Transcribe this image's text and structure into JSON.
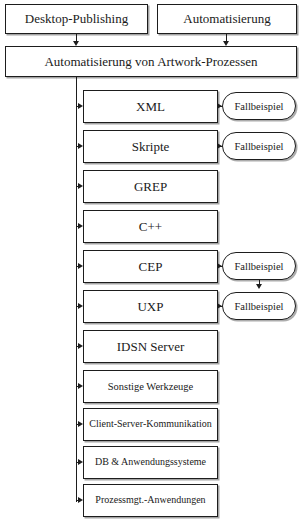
{
  "diagram": {
    "title": "Automatisierung von Artwork-Prozessen",
    "type": "flowchart",
    "colors": {
      "stroke": "#1d1d1d",
      "fill": "#ffffff",
      "shadow": "#5a5a5a"
    },
    "top_row": [
      {
        "id": "dtp",
        "label": "Desktop-Publishing"
      },
      {
        "id": "auto",
        "label": "Automatisierung"
      }
    ],
    "master": {
      "id": "master",
      "label": "Automatisierung von Artwork-Prozessen"
    },
    "items": [
      {
        "id": "xml",
        "label": "XML",
        "case_example": "Fallbeispiel"
      },
      {
        "id": "skripte",
        "label": "Skripte",
        "case_example": "Fallbeispiel"
      },
      {
        "id": "grep",
        "label": "GREP",
        "case_example": null
      },
      {
        "id": "cpp",
        "label": "C++",
        "case_example": null
      },
      {
        "id": "cep",
        "label": "CEP",
        "case_example": "Fallbeispiel"
      },
      {
        "id": "uxp",
        "label": "UXP",
        "case_example": "Fallbeispiel"
      },
      {
        "id": "idsn",
        "label": "IDSN Server",
        "case_example": null
      },
      {
        "id": "sonstige",
        "label": "Sonstige Werkzeuge",
        "case_example": null
      },
      {
        "id": "csk",
        "label": "Client-Server-Kommunikation",
        "case_example": null
      },
      {
        "id": "dbanw",
        "label": "DB & Anwendungssysteme",
        "case_example": null
      },
      {
        "id": "prozmgt",
        "label": "Prozessmgt.-Anwendungen",
        "case_example": null
      }
    ],
    "connectors": [
      {
        "from": "dtp",
        "to": "master",
        "kind": "arrow-down"
      },
      {
        "from": "auto",
        "to": "master",
        "kind": "arrow-down"
      },
      {
        "from": "master",
        "to": "items",
        "kind": "trunk-branch"
      },
      {
        "from": "cep.case_example",
        "to": "uxp.case_example",
        "kind": "arrow-down"
      }
    ]
  }
}
